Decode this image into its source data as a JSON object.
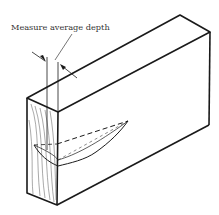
{
  "diagram": {
    "annotation": {
      "label": "Measure average depth"
    },
    "colors": {
      "line": "#1a1a1a",
      "background": "#ffffff"
    }
  }
}
